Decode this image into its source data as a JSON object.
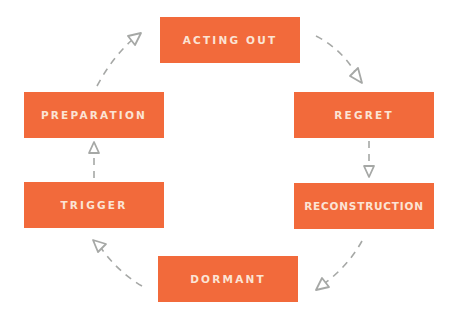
{
  "colors": {
    "box_fill": "#f26a3b",
    "box_text": "#fbe4d5",
    "arrow": "#a6a8a6",
    "background": "#ffffff"
  },
  "nodes": [
    {
      "id": "acting-out",
      "label": "ACTING OUT",
      "x": 160,
      "y": 17,
      "w": 140,
      "h": 46
    },
    {
      "id": "regret",
      "label": "REGRET",
      "x": 294,
      "y": 92,
      "w": 140,
      "h": 46
    },
    {
      "id": "reconstruction",
      "label": "RECONSTRUCTION",
      "x": 294,
      "y": 183,
      "w": 140,
      "h": 46
    },
    {
      "id": "dormant",
      "label": "DORMANT",
      "x": 158,
      "y": 256,
      "w": 140,
      "h": 46
    },
    {
      "id": "trigger",
      "label": "TRIGGER",
      "x": 24,
      "y": 182,
      "w": 140,
      "h": 46
    },
    {
      "id": "preparation",
      "label": "PREPARATION",
      "x": 24,
      "y": 92,
      "w": 140,
      "h": 46
    }
  ],
  "edges": [
    {
      "from": "acting-out",
      "to": "regret"
    },
    {
      "from": "regret",
      "to": "reconstruction"
    },
    {
      "from": "reconstruction",
      "to": "dormant"
    },
    {
      "from": "dormant",
      "to": "trigger"
    },
    {
      "from": "trigger",
      "to": "preparation"
    },
    {
      "from": "preparation",
      "to": "acting-out"
    }
  ]
}
